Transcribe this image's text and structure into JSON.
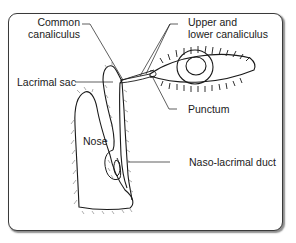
{
  "diagram": {
    "labels": {
      "common_canaliculus_line1": "Common",
      "common_canaliculus_line2": "canaliculus",
      "upper_lower_line1": "Upper and",
      "upper_lower_line2": "lower canaliculus",
      "lacrimal_sac": "Lacrimal sac",
      "punctum": "Punctum",
      "nose": "Nose",
      "nasolacrimal_duct": "Naso-lacrimal duct"
    },
    "colors": {
      "line": "#1a1a1a",
      "frame": "#3a3a3a",
      "background": "#ffffff"
    }
  }
}
